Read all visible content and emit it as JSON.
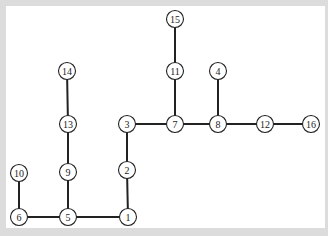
{
  "diagram": {
    "type": "tree",
    "nodes": [
      {
        "id": "1",
        "label": "1",
        "x": 128,
        "y": 217
      },
      {
        "id": "2",
        "label": "2",
        "x": 127,
        "y": 170
      },
      {
        "id": "3",
        "label": "3",
        "x": 127,
        "y": 124
      },
      {
        "id": "4",
        "label": "4",
        "x": 218,
        "y": 71
      },
      {
        "id": "5",
        "label": "5",
        "x": 68,
        "y": 217
      },
      {
        "id": "6",
        "label": "6",
        "x": 19,
        "y": 217
      },
      {
        "id": "7",
        "label": "7",
        "x": 175,
        "y": 124
      },
      {
        "id": "8",
        "label": "8",
        "x": 218,
        "y": 124
      },
      {
        "id": "9",
        "label": "9",
        "x": 68,
        "y": 172
      },
      {
        "id": "10",
        "label": "10",
        "x": 19,
        "y": 173
      },
      {
        "id": "11",
        "label": "11",
        "x": 175,
        "y": 71
      },
      {
        "id": "12",
        "label": "12",
        "x": 265,
        "y": 124
      },
      {
        "id": "13",
        "label": "13",
        "x": 68,
        "y": 124
      },
      {
        "id": "14",
        "label": "14",
        "x": 67,
        "y": 71
      },
      {
        "id": "15",
        "label": "15",
        "x": 175,
        "y": 19
      },
      {
        "id": "16",
        "label": "16",
        "x": 311,
        "y": 124
      }
    ],
    "edges": [
      [
        "6",
        "5"
      ],
      [
        "5",
        "1"
      ],
      [
        "6",
        "10"
      ],
      [
        "5",
        "9"
      ],
      [
        "9",
        "13"
      ],
      [
        "13",
        "14"
      ],
      [
        "1",
        "2"
      ],
      [
        "2",
        "3"
      ],
      [
        "3",
        "7"
      ],
      [
        "7",
        "8"
      ],
      [
        "8",
        "12"
      ],
      [
        "12",
        "16"
      ],
      [
        "7",
        "11"
      ],
      [
        "11",
        "15"
      ],
      [
        "8",
        "4"
      ]
    ]
  }
}
